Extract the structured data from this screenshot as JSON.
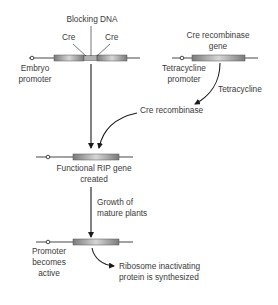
{
  "diagram": {
    "colors": {
      "line": "#1a1a1a",
      "gene_bar_dark": "#7a7a7a",
      "gene_bar_light": "#d6d6d6",
      "text": "#3a3a3a",
      "background": "#ffffff"
    },
    "top_left_construct": {
      "blocking_dna_label": "Blocking DNA",
      "cre_left_label": "Cre",
      "cre_right_label": "Cre",
      "promoter_label_line1": "Embryo",
      "promoter_label_line2": "promoter"
    },
    "top_right_construct": {
      "gene_label_line1": "Cre recombinase",
      "gene_label_line2": "gene",
      "promoter_label_line1": "Tetracycline",
      "promoter_label_line2": "promoter",
      "inducer_label": "Tetracycline"
    },
    "cre_recombinase_label": "Cre recombinase",
    "middle_construct": {
      "label_line1": "Functional RIP gene",
      "label_line2": "created"
    },
    "growth_step": {
      "label_line1": "Growth of",
      "label_line2": "mature plants"
    },
    "bottom_construct": {
      "promoter_label_line1": "Promoter",
      "promoter_label_line2": "becomes",
      "promoter_label_line3": "active",
      "result_label_line1": "Ribosome inactivating",
      "result_label_line2": "protein is synthesized"
    }
  }
}
